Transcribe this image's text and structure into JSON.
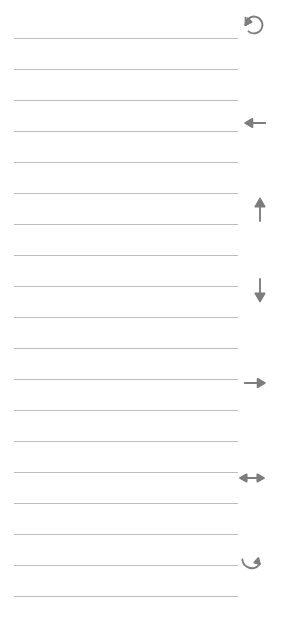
{
  "page": {
    "kind": "ruled-notepaper-with-margin-arrow-icons",
    "width": 285,
    "height": 633,
    "background_color": "#ffffff",
    "rule_color": "#b9b9b9",
    "icon_color": "#7d7d7d"
  },
  "rules": {
    "count": 19,
    "left_x": 14,
    "right_x": 238,
    "first_y": 38,
    "spacing": 31,
    "lines": [
      {
        "y": 38,
        "left": 14,
        "right": 238
      },
      {
        "y": 69,
        "left": 14,
        "right": 238
      },
      {
        "y": 100,
        "left": 14,
        "right": 238
      },
      {
        "y": 131,
        "left": 14,
        "right": 238
      },
      {
        "y": 162,
        "left": 14,
        "right": 238
      },
      {
        "y": 193,
        "left": 14,
        "right": 238
      },
      {
        "y": 224,
        "left": 14,
        "right": 238
      },
      {
        "y": 255,
        "left": 14,
        "right": 238
      },
      {
        "y": 286,
        "left": 14,
        "right": 238
      },
      {
        "y": 317,
        "left": 14,
        "right": 238
      },
      {
        "y": 348,
        "left": 14,
        "right": 238
      },
      {
        "y": 379,
        "left": 14,
        "right": 238
      },
      {
        "y": 410,
        "left": 14,
        "right": 238
      },
      {
        "y": 441,
        "left": 14,
        "right": 238
      },
      {
        "y": 472,
        "left": 14,
        "right": 238
      },
      {
        "y": 503,
        "left": 14,
        "right": 238
      },
      {
        "y": 534,
        "left": 14,
        "right": 238
      },
      {
        "y": 565,
        "left": 14,
        "right": 238
      },
      {
        "y": 596,
        "left": 14,
        "right": 238
      }
    ]
  },
  "margin_icons": {
    "count": 7,
    "items": [
      {
        "name": "rotate-counterclockwise-icon",
        "glyph": "↺",
        "x": 238,
        "y": 9,
        "size": 32
      },
      {
        "name": "arrow-left-icon",
        "glyph": "←",
        "x": 240,
        "y": 108,
        "size": 30
      },
      {
        "name": "arrow-up-icon",
        "glyph": "↑",
        "x": 244,
        "y": 193,
        "size": 32
      },
      {
        "name": "arrow-down-icon",
        "glyph": "↓",
        "x": 244,
        "y": 275,
        "size": 32
      },
      {
        "name": "arrow-right-icon",
        "glyph": "→",
        "x": 240,
        "y": 368,
        "size": 30
      },
      {
        "name": "arrow-left-right-icon",
        "glyph": "↔",
        "x": 236,
        "y": 462,
        "size": 32
      },
      {
        "name": "rotate-clockwise-icon",
        "glyph": "↻",
        "x": 236,
        "y": 547,
        "size": 32
      }
    ]
  }
}
